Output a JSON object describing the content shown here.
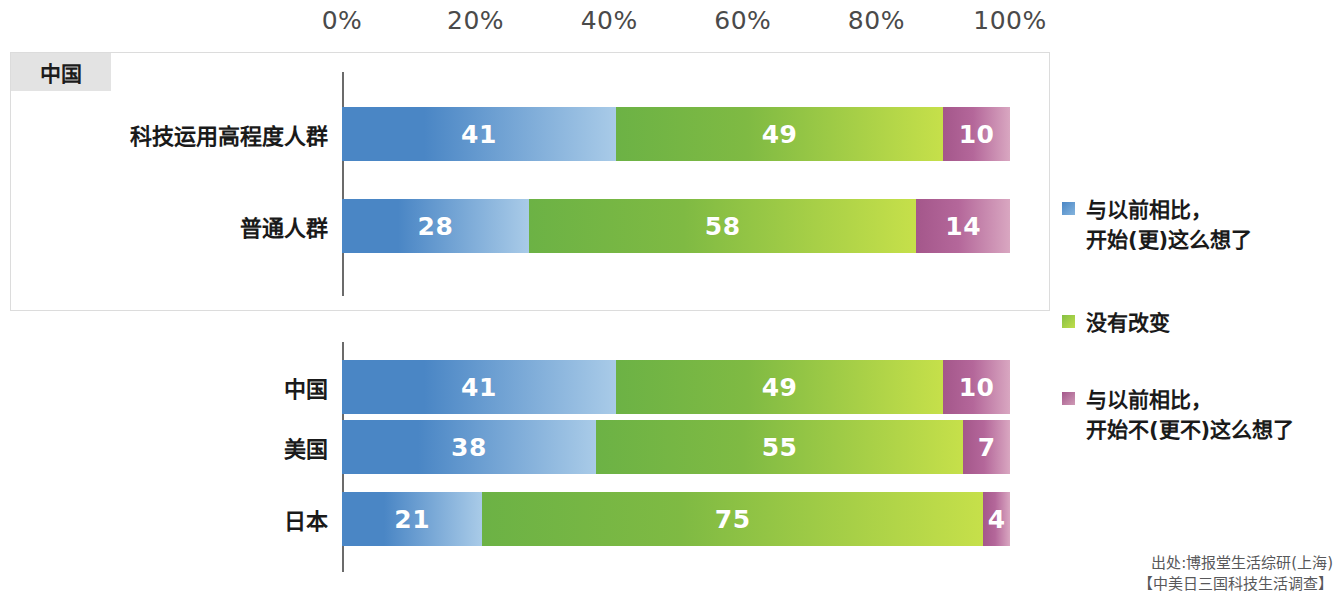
{
  "axis": {
    "ticks": [
      "0%",
      "20%",
      "40%",
      "60%",
      "80%",
      "100%"
    ],
    "min": 0,
    "max": 100
  },
  "panel_top": {
    "tab_label": "中国"
  },
  "legend": {
    "items": [
      {
        "label": "与以前相比，\n开始(更)这么想了",
        "color": "#4a86c5",
        "name": "more-than-before"
      },
      {
        "label": "没有改变",
        "color": "#85c044",
        "name": "no-change"
      },
      {
        "label": "与以前相比，\n开始不(更不)这么想了",
        "color": "#a4578b",
        "name": "less-than-before"
      }
    ]
  },
  "source": {
    "line1": "出处:博报堂生活综研(上海)",
    "line2": "【中美日三国科技生活调查】"
  },
  "chart_data": {
    "type": "bar",
    "orientation": "horizontal",
    "stacked": true,
    "stacked_percent": true,
    "title": "",
    "xlabel": "",
    "ylabel": "",
    "xlim": [
      0,
      100
    ],
    "grid": false,
    "legend_position": "right",
    "series": [
      {
        "name": "与以前相比，开始(更)这么想了",
        "color": "#4a86c5"
      },
      {
        "name": "没有改变",
        "color": "#85c044"
      },
      {
        "name": "与以前相比，开始不(更不)这么想了",
        "color": "#a4578b"
      }
    ],
    "groups": [
      {
        "group_label": "中国",
        "categories": [
          "科技运用高程度人群",
          "普通人群"
        ],
        "values": [
          [
            41,
            49,
            10
          ],
          [
            28,
            58,
            14
          ]
        ]
      },
      {
        "group_label": "",
        "categories": [
          "中国",
          "美国",
          "日本"
        ],
        "values": [
          [
            41,
            49,
            10
          ],
          [
            38,
            55,
            7
          ],
          [
            21,
            75,
            4
          ]
        ]
      }
    ]
  }
}
